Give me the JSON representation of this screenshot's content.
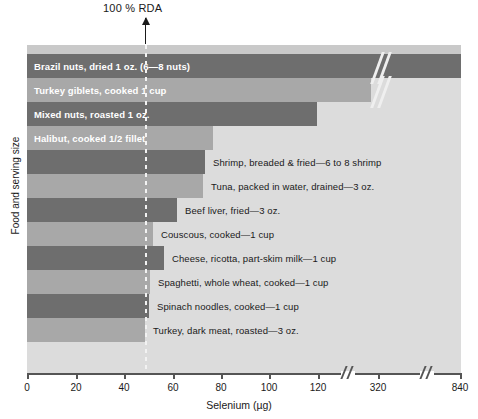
{
  "chart_data": {
    "type": "bar",
    "orientation": "horizontal",
    "title": "",
    "xlabel": "Selenium (µg)",
    "ylabel": "Food and serving size",
    "xlim": [
      0,
      840
    ],
    "grid": false,
    "axis_breaks": [
      130,
      350
    ],
    "xticks": [
      0,
      20,
      40,
      60,
      80,
      100,
      120,
      320,
      840
    ],
    "xticklabels": [
      "0",
      "20",
      "40",
      "60",
      "80",
      "100",
      "120",
      "320",
      "840"
    ],
    "annotations": [
      {
        "text": "100 % RDA",
        "value": 55,
        "style": "dashed-line-with-arrow"
      }
    ],
    "categories": [
      "Brazil nuts, dried 1 oz. (6—8 nuts)",
      "Turkey giblets, cooked 1 cup",
      "Mixed nuts, roasted 1 oz.",
      "Halibut, cooked 1/2 fillet",
      "Shrimp, breaded & fried—6 to 8 shrimp",
      "Tuna, packed in water, drained—3 oz.",
      "Beef liver, fried—3 oz.",
      "Couscous, cooked—1 cup",
      "Cheese, ricotta, part-skim milk—1 cup",
      "Spaghetti, whole wheat, cooked—1 cup",
      "Spinach noodles, cooked—1 cup",
      "Turkey, dark meat, roasted—3 oz."
    ],
    "values": [
      840,
      340,
      118,
      67,
      64,
      63,
      52,
      42,
      45,
      41,
      40,
      35
    ],
    "bars": [
      {
        "label": "Brazil nuts, dried 1 oz. (6—8 nuts)",
        "value": 840,
        "shade": "dark",
        "label_inside": true,
        "px_width": 434
      },
      {
        "label": "Turkey giblets, cooked 1 cup",
        "value": 340,
        "shade": "light",
        "label_inside": true,
        "px_width": 344
      },
      {
        "label": "Mixed nuts, roasted 1 oz.",
        "value": 118,
        "shade": "dark",
        "label_inside": true,
        "px_width": 290
      },
      {
        "label": "Halibut, cooked 1/2 fillet",
        "value": 67,
        "shade": "light",
        "label_inside": true,
        "px_width": 186
      },
      {
        "label": "Shrimp, breaded & fried—6 to 8 shrimp",
        "value": 64,
        "shade": "dark",
        "label_inside": false,
        "px_width": 178
      },
      {
        "label": "Tuna, packed in water, drained—3 oz.",
        "value": 63,
        "shade": "light",
        "label_inside": false,
        "px_width": 176
      },
      {
        "label": "Beef liver, fried—3 oz.",
        "value": 52,
        "shade": "dark",
        "label_inside": false,
        "px_width": 150
      },
      {
        "label": "Couscous, cooked—1 cup",
        "value": 42,
        "shade": "light",
        "label_inside": false,
        "px_width": 126
      },
      {
        "label": "Cheese, ricotta, part-skim milk—1 cup",
        "value": 45,
        "shade": "dark",
        "label_inside": false,
        "px_width": 137
      },
      {
        "label": "Spaghetti, whole wheat, cooked—1 cup",
        "value": 41,
        "shade": "light",
        "label_inside": false,
        "px_width": 123
      },
      {
        "label": "Spinach noodles, cooked—1 cup",
        "value": 40,
        "shade": "dark",
        "label_inside": false,
        "px_width": 122
      },
      {
        "label": "Turkey, dark meat, roasted—3 oz.",
        "value": 35,
        "shade": "light",
        "label_inside": false,
        "px_width": 118
      }
    ],
    "colors": {
      "bar_dark": "#6e6e6e",
      "bar_light": "#a8a8a8",
      "plot_background": "#dcdcdc",
      "axis": "#555555",
      "text": "#1a1a1a",
      "inside_label_text": "#ffffff"
    }
  },
  "annotation": {
    "rda_text": "100 % RDA"
  },
  "axes": {
    "x_title": "Selenium (µg)",
    "y_title": "Food and serving size",
    "tick_labels": [
      "0",
      "20",
      "40",
      "60",
      "80",
      "100",
      "120",
      "320",
      "840"
    ]
  }
}
